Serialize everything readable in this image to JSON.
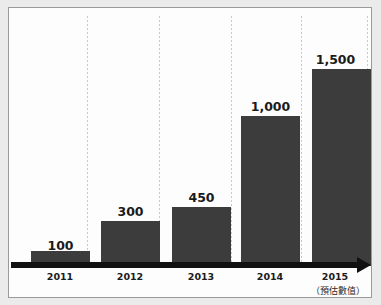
{
  "header": {
    "clipped_text": "··· ··  ·······"
  },
  "footnote": "（預估數值）",
  "chart_data": {
    "type": "bar",
    "title": "",
    "subtitle": "",
    "xlabel": "",
    "ylabel": "",
    "categories": [
      "2011",
      "2012",
      "2013",
      "2014",
      "2015"
    ],
    "values": [
      100,
      300,
      450,
      1000,
      1500
    ],
    "data_labels": [
      "100",
      "300",
      "450",
      "1,000",
      "1,500"
    ],
    "ylim": [
      0,
      1650
    ],
    "grid": "vertical-dotted",
    "legend": "none",
    "annotations": [
      "（預估數值）"
    ],
    "series": [
      {
        "name": "",
        "values": [
          100,
          300,
          450,
          1000,
          1500
        ]
      }
    ],
    "colors": {
      "bar": "#3c3c3c",
      "axis": "#111111",
      "gridline": "#c9c9c9",
      "label_text": "#1b1b1b",
      "panel_background": "#fdfdfd",
      "page_background": "#ebebeb",
      "panel_border": "#9a9a9a"
    }
  },
  "bars": [
    {
      "label": "2011",
      "value": "100",
      "left": 22,
      "width": 59,
      "height": 15,
      "label_left": 22,
      "label_top": 230,
      "center": 51
    },
    {
      "label": "2012",
      "value": "300",
      "left": 92,
      "width": 59,
      "height": 45,
      "label_left": 92,
      "label_top": 196,
      "center": 121
    },
    {
      "label": "2013",
      "value": "450",
      "left": 163,
      "width": 59,
      "height": 59,
      "label_left": 163,
      "label_top": 182,
      "center": 192
    },
    {
      "label": "2014",
      "value": "1,000",
      "left": 232,
      "width": 59,
      "height": 150,
      "label_left": 232,
      "label_top": 91,
      "center": 261
    },
    {
      "label": "2015",
      "value": "1,500",
      "left": 303,
      "width": 59,
      "height": 197,
      "label_left": 297,
      "label_top": 44,
      "center": 326
    }
  ],
  "gridlines": [
    78,
    150,
    222,
    292,
    358
  ]
}
